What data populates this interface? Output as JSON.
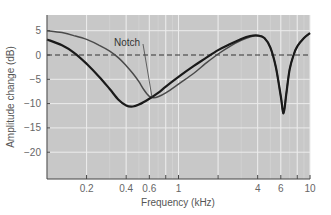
{
  "chart_data": {
    "type": "line",
    "title": "",
    "xlabel": "Frequency (kHz)",
    "ylabel": "Amplitude change (dB)",
    "xscale": "log",
    "xlim": [
      0.1,
      10
    ],
    "ylim": [
      -25.5,
      8
    ],
    "grid": true,
    "legend": null,
    "x_ticks": [
      0.2,
      0.4,
      0.6,
      0.8,
      1,
      2,
      4,
      6,
      8,
      10
    ],
    "x_tick_labels": [
      {
        "value": 0.2,
        "label": "0.2"
      },
      {
        "value": 0.4,
        "label": "0.4"
      },
      {
        "value": 0.6,
        "label": "0.6"
      },
      {
        "value": 1,
        "label": "1"
      },
      {
        "value": 4,
        "label": "4"
      },
      {
        "value": 6,
        "label": "6"
      },
      {
        "value": 10,
        "label": "10"
      }
    ],
    "y_ticks": [
      5,
      0,
      -5,
      -10,
      -15,
      -20
    ],
    "y_tick_labels": [
      "5",
      "0",
      "−5",
      "−10",
      "−15",
      "−20"
    ],
    "reference_line": {
      "y": 0,
      "style": "dashed"
    },
    "annotations": [
      {
        "text": "Notch",
        "x": 0.62,
        "y": -7.5
      }
    ],
    "series": [
      {
        "name": "thick curve",
        "color": "#1a1a1a",
        "width": 2.2,
        "points": [
          [
            0.1,
            3.2
          ],
          [
            0.13,
            2.0
          ],
          [
            0.16,
            0.5
          ],
          [
            0.2,
            -1.8
          ],
          [
            0.25,
            -4.5
          ],
          [
            0.3,
            -7.0
          ],
          [
            0.35,
            -9.2
          ],
          [
            0.4,
            -10.4
          ],
          [
            0.45,
            -10.6
          ],
          [
            0.5,
            -10.2
          ],
          [
            0.6,
            -9.0
          ],
          [
            0.7,
            -7.8
          ],
          [
            0.8,
            -6.5
          ],
          [
            1.0,
            -4.5
          ],
          [
            1.3,
            -2.3
          ],
          [
            1.6,
            -0.7
          ],
          [
            2.0,
            1.0
          ],
          [
            2.5,
            2.3
          ],
          [
            3.0,
            3.3
          ],
          [
            3.5,
            3.9
          ],
          [
            4.0,
            4.0
          ],
          [
            4.5,
            3.5
          ],
          [
            5.0,
            1.5
          ],
          [
            5.5,
            -2.5
          ],
          [
            6.0,
            -8.5
          ],
          [
            6.3,
            -12.0
          ],
          [
            6.6,
            -8.0
          ],
          [
            7.0,
            -3.0
          ],
          [
            7.5,
            0.0
          ],
          [
            8.0,
            1.8
          ],
          [
            9.0,
            3.5
          ],
          [
            10.0,
            4.5
          ]
        ]
      },
      {
        "name": "thin curve",
        "color": "#4a4a4a",
        "width": 1.5,
        "points": [
          [
            0.1,
            5.0
          ],
          [
            0.13,
            4.6
          ],
          [
            0.16,
            4.0
          ],
          [
            0.2,
            3.2
          ],
          [
            0.25,
            2.0
          ],
          [
            0.3,
            0.8
          ],
          [
            0.35,
            -0.6
          ],
          [
            0.4,
            -2.2
          ],
          [
            0.45,
            -3.8
          ],
          [
            0.5,
            -5.5
          ],
          [
            0.55,
            -7.3
          ],
          [
            0.6,
            -8.5
          ],
          [
            0.65,
            -8.8
          ],
          [
            0.7,
            -8.6
          ],
          [
            0.8,
            -7.8
          ],
          [
            1.0,
            -6.0
          ],
          [
            1.3,
            -3.8
          ],
          [
            1.6,
            -1.8
          ],
          [
            2.0,
            0.2
          ],
          [
            2.5,
            1.9
          ],
          [
            3.0,
            3.0
          ],
          [
            3.5,
            3.7
          ],
          [
            4.0,
            4.0
          ],
          [
            4.5,
            3.5
          ],
          [
            5.0,
            1.5
          ],
          [
            5.5,
            -2.5
          ],
          [
            6.0,
            -8.5
          ],
          [
            6.3,
            -12.0
          ],
          [
            6.6,
            -8.0
          ],
          [
            7.0,
            -3.0
          ],
          [
            7.5,
            0.0
          ],
          [
            8.0,
            1.8
          ],
          [
            9.0,
            3.5
          ],
          [
            10.0,
            4.5
          ]
        ]
      }
    ],
    "colors": {
      "plot_background": "#c8c8c8",
      "grid_major": "#ececec",
      "grid_minor": "#d6d6d6",
      "axis": "#444444"
    }
  }
}
